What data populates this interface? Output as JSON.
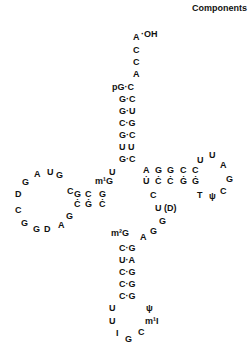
{
  "title": "Components",
  "diagram": "tRNA cloverleaf secondary structure",
  "nucleotides": [
    {
      "t": "A",
      "x": 133,
      "y": 32
    },
    {
      "t": "·OH",
      "x": 141,
      "y": 29
    },
    {
      "t": "C",
      "x": 133,
      "y": 45
    },
    {
      "t": "C",
      "x": 133,
      "y": 57
    },
    {
      "t": "A",
      "x": 133,
      "y": 69
    },
    {
      "t": "pG·C",
      "x": 112,
      "y": 82
    },
    {
      "t": "G·C",
      "x": 119,
      "y": 94
    },
    {
      "t": "G·U",
      "x": 119,
      "y": 106
    },
    {
      "t": "C·G",
      "x": 119,
      "y": 118
    },
    {
      "t": "G·C",
      "x": 119,
      "y": 130
    },
    {
      "t": "U U",
      "x": 119,
      "y": 142
    },
    {
      "t": "G·C",
      "x": 119,
      "y": 154
    },
    {
      "t": "U",
      "x": 109,
      "y": 167
    },
    {
      "t": "m¹G",
      "x": 95,
      "y": 176
    },
    {
      "t": "G",
      "x": 99,
      "y": 189
    },
    {
      "t": "C",
      "x": 85,
      "y": 189
    },
    {
      "t": "G",
      "x": 74,
      "y": 189
    },
    {
      "t": "C",
      "x": 67,
      "y": 186
    },
    {
      "t": "Ċ",
      "x": 99,
      "y": 199
    },
    {
      "t": "Ġ",
      "x": 85,
      "y": 199
    },
    {
      "t": "Ċ",
      "x": 74,
      "y": 199
    },
    {
      "t": "G",
      "x": 56,
      "y": 170
    },
    {
      "t": "U",
      "x": 47,
      "y": 167
    },
    {
      "t": "A",
      "x": 34,
      "y": 169
    },
    {
      "t": "G",
      "x": 22,
      "y": 177
    },
    {
      "t": "D",
      "x": 15,
      "y": 189
    },
    {
      "t": "C",
      "x": 15,
      "y": 205
    },
    {
      "t": "G",
      "x": 21,
      "y": 218
    },
    {
      "t": "G",
      "x": 33,
      "y": 224
    },
    {
      "t": "D",
      "x": 44,
      "y": 224
    },
    {
      "t": "A",
      "x": 58,
      "y": 220
    },
    {
      "t": "G",
      "x": 66,
      "y": 211
    },
    {
      "t": "A",
      "x": 143,
      "y": 165
    },
    {
      "t": "G",
      "x": 155,
      "y": 165
    },
    {
      "t": "G",
      "x": 167,
      "y": 165
    },
    {
      "t": "C",
      "x": 180,
      "y": 165
    },
    {
      "t": "C",
      "x": 192,
      "y": 165
    },
    {
      "t": "U̇",
      "x": 143,
      "y": 176
    },
    {
      "t": "Ċ",
      "x": 155,
      "y": 176
    },
    {
      "t": "Ċ",
      "x": 167,
      "y": 176
    },
    {
      "t": "Ġ",
      "x": 180,
      "y": 176
    },
    {
      "t": "Ġ",
      "x": 192,
      "y": 176
    },
    {
      "t": "U",
      "x": 197,
      "y": 155
    },
    {
      "t": "U",
      "x": 209,
      "y": 150
    },
    {
      "t": "A",
      "x": 220,
      "y": 160
    },
    {
      "t": "G",
      "x": 226,
      "y": 174
    },
    {
      "t": "C",
      "x": 220,
      "y": 186
    },
    {
      "t": "ψ",
      "x": 209,
      "y": 191
    },
    {
      "t": "T",
      "x": 197,
      "y": 190
    },
    {
      "t": "C",
      "x": 150,
      "y": 190
    },
    {
      "t": "U (D)",
      "x": 155,
      "y": 203
    },
    {
      "t": "G",
      "x": 159,
      "y": 216
    },
    {
      "t": "G",
      "x": 150,
      "y": 226
    },
    {
      "t": "A",
      "x": 140,
      "y": 232
    },
    {
      "t": "m²G",
      "x": 111,
      "y": 228
    },
    {
      "t": "C·G",
      "x": 119,
      "y": 243
    },
    {
      "t": "U·A",
      "x": 119,
      "y": 255
    },
    {
      "t": "C·G",
      "x": 119,
      "y": 267
    },
    {
      "t": "C·G",
      "x": 119,
      "y": 279
    },
    {
      "t": "C·G",
      "x": 119,
      "y": 291
    },
    {
      "t": "U",
      "x": 109,
      "y": 303
    },
    {
      "t": "U",
      "x": 109,
      "y": 316
    },
    {
      "t": "I",
      "x": 116,
      "y": 328
    },
    {
      "t": "G",
      "x": 125,
      "y": 334
    },
    {
      "t": "C",
      "x": 138,
      "y": 327
    },
    {
      "t": "m¹I",
      "x": 145,
      "y": 316
    },
    {
      "t": "ψ",
      "x": 146,
      "y": 303
    }
  ]
}
